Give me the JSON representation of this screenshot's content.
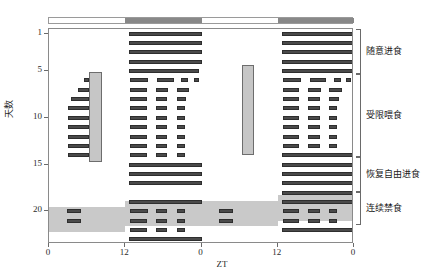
{
  "figure": {
    "type": "actogram",
    "title": "",
    "x_axis": {
      "label": "ZT",
      "ticks": [
        "0",
        "12",
        "0",
        "12",
        "0"
      ],
      "tick_positions_zt": [
        0,
        12,
        24,
        36,
        48
      ],
      "range_hours": [
        0,
        48
      ],
      "double_plotted": true
    },
    "y_axis": {
      "label": "天数",
      "ticks": [
        "1",
        "5",
        "10",
        "15",
        "20"
      ],
      "tick_values": [
        1,
        5,
        10,
        15,
        20
      ],
      "range_days": [
        0.5,
        23.5
      ],
      "direction": "top-to-bottom"
    },
    "light_dark_bar": {
      "segments": [
        {
          "name": "light-phase-day1",
          "zt_start": 0,
          "zt_end": 12,
          "color": "#ffffff"
        },
        {
          "name": "dark-phase-day1",
          "zt_start": 12,
          "zt_end": 24,
          "color": "#888888"
        },
        {
          "name": "light-phase-day2",
          "zt_start": 24,
          "zt_end": 36,
          "color": "#ffffff"
        },
        {
          "name": "dark-phase-day2",
          "zt_start": 36,
          "zt_end": 48,
          "color": "#888888"
        }
      ]
    },
    "phases": [
      {
        "id": "adlib",
        "label": "随意进食",
        "day_start": 0.6,
        "day_end": 5.4
      },
      {
        "id": "restricted",
        "label": "受限喂食",
        "day_start": 5.4,
        "day_end": 14.3
      },
      {
        "id": "refeed",
        "label": "恢复自由进食",
        "day_start": 14.3,
        "day_end": 18.0
      },
      {
        "id": "fasting",
        "label": "连续禁食",
        "day_start": 18.0,
        "day_end": 21.6
      }
    ],
    "feeding_windows": [
      {
        "name": "food-access-window-1",
        "zt_start": 6.3,
        "zt_end": 8.3,
        "day_start": 5.1,
        "day_end": 14.7,
        "color": "#c6c6c6"
      },
      {
        "name": "food-access-window-2",
        "zt_start": 30.3,
        "zt_end": 32.3,
        "day_start": 4.3,
        "day_end": 14.0,
        "color": "#c6c6c6"
      }
    ],
    "fasting_band": {
      "color": "#c9c9c9",
      "steps": [
        {
          "zt_start": 0,
          "zt_end": 12,
          "day_start": 19.5,
          "day_end": 22.2
        },
        {
          "zt_start": 12,
          "zt_end": 36,
          "day_start": 18.9,
          "day_end": 21.6
        },
        {
          "zt_start": 36,
          "zt_end": 48,
          "day_start": 18.3,
          "day_end": 21.0
        }
      ]
    },
    "bar_color": "#4a4a4a",
    "bar_edge_color": "#2e2e2e"
  },
  "chart_data": {
    "type": "actogram",
    "title": "",
    "xlabel": "ZT",
    "ylabel": "天数",
    "xlim": [
      0,
      48
    ],
    "ylim": [
      23.5,
      0.5
    ],
    "xticks": [
      0,
      12,
      24,
      36,
      48
    ],
    "xticklabels": [
      "0",
      "12",
      "0",
      "12",
      "0"
    ],
    "yticks": [
      1,
      5,
      10,
      15,
      20
    ],
    "yticklabels": [
      "1",
      "5",
      "10",
      "15",
      "20"
    ],
    "grid": false,
    "legend": "right-brackets",
    "note": "Each row is one day (double-plotted, 48 h). Bouts listed as [ZT_start, ZT_end].",
    "rows": [
      {
        "day": 1,
        "bouts": [
          [
            12.6,
            24.0
          ],
          [
            36.6,
            48.0
          ]
        ]
      },
      {
        "day": 2,
        "bouts": [
          [
            12.6,
            24.0
          ],
          [
            36.6,
            48.0
          ]
        ]
      },
      {
        "day": 3,
        "bouts": [
          [
            12.6,
            24.0
          ],
          [
            36.6,
            48.0
          ]
        ]
      },
      {
        "day": 4,
        "bouts": [
          [
            12.6,
            24.0
          ],
          [
            36.6,
            48.0
          ]
        ]
      },
      {
        "day": 5,
        "bouts": [
          [
            12.6,
            23.6
          ],
          [
            36.6,
            48.0
          ]
        ]
      },
      {
        "day": 6,
        "bouts": [
          [
            5.5,
            6.3
          ],
          [
            12.8,
            15.6
          ],
          [
            17.0,
            19.6
          ],
          [
            20.8,
            21.9
          ],
          [
            22.8,
            23.6
          ],
          [
            36.8,
            39.6
          ],
          [
            41.0,
            43.6
          ],
          [
            44.8,
            45.9
          ],
          [
            46.8,
            47.6
          ]
        ]
      },
      {
        "day": 7,
        "bouts": [
          [
            4.6,
            6.3
          ],
          [
            12.8,
            15.4
          ],
          [
            16.8,
            18.8
          ],
          [
            20.1,
            22.1
          ],
          [
            36.8,
            39.4
          ],
          [
            40.8,
            42.8
          ],
          [
            44.1,
            46.1
          ]
        ]
      },
      {
        "day": 8,
        "bouts": [
          [
            3.5,
            6.3
          ],
          [
            12.8,
            15.4
          ],
          [
            16.8,
            18.6
          ],
          [
            20.1,
            21.6
          ],
          [
            36.8,
            39.4
          ],
          [
            40.8,
            42.6
          ],
          [
            44.1,
            45.6
          ]
        ]
      },
      {
        "day": 9,
        "bouts": [
          [
            3.0,
            6.3
          ],
          [
            12.8,
            15.4
          ],
          [
            16.8,
            18.6
          ],
          [
            20.1,
            21.4
          ],
          [
            36.8,
            39.4
          ],
          [
            40.8,
            42.6
          ],
          [
            44.1,
            45.4
          ]
        ]
      },
      {
        "day": 10,
        "bouts": [
          [
            3.0,
            6.3
          ],
          [
            12.8,
            15.4
          ],
          [
            16.8,
            18.6
          ],
          [
            20.1,
            21.4
          ],
          [
            36.8,
            39.4
          ],
          [
            40.8,
            42.6
          ],
          [
            44.1,
            45.4
          ]
        ]
      },
      {
        "day": 11,
        "bouts": [
          [
            3.0,
            6.3
          ],
          [
            12.8,
            15.4
          ],
          [
            16.8,
            18.6
          ],
          [
            20.1,
            21.4
          ],
          [
            36.8,
            39.4
          ],
          [
            40.8,
            42.6
          ],
          [
            44.1,
            45.4
          ]
        ]
      },
      {
        "day": 12,
        "bouts": [
          [
            3.0,
            6.3
          ],
          [
            12.8,
            15.4
          ],
          [
            16.8,
            18.6
          ],
          [
            20.1,
            21.4
          ],
          [
            36.8,
            39.4
          ],
          [
            40.8,
            42.6
          ],
          [
            44.1,
            45.4
          ]
        ]
      },
      {
        "day": 13,
        "bouts": [
          [
            3.0,
            6.3
          ],
          [
            12.8,
            15.4
          ],
          [
            16.8,
            18.6
          ],
          [
            20.1,
            21.4
          ],
          [
            36.8,
            39.4
          ],
          [
            40.8,
            42.6
          ],
          [
            44.1,
            45.4
          ]
        ]
      },
      {
        "day": 14,
        "bouts": [
          [
            3.0,
            6.3
          ],
          [
            12.8,
            15.4
          ],
          [
            16.8,
            18.6
          ],
          [
            20.1,
            21.4
          ],
          [
            36.6,
            48.0
          ]
        ]
      },
      {
        "day": 15,
        "bouts": [
          [
            12.6,
            24.0
          ],
          [
            36.6,
            48.0
          ]
        ]
      },
      {
        "day": 16,
        "bouts": [
          [
            12.6,
            24.0
          ],
          [
            36.6,
            48.0
          ]
        ]
      },
      {
        "day": 17,
        "bouts": [
          [
            12.6,
            24.0
          ],
          [
            36.6,
            48.0
          ]
        ]
      },
      {
        "day": 18,
        "bouts": [
          [
            36.6,
            48.0
          ]
        ]
      },
      {
        "day": 19,
        "bouts": [
          [
            12.6,
            24.0
          ],
          [
            36.6,
            48.0
          ]
        ]
      },
      {
        "day": 20,
        "bouts": [
          [
            2.8,
            5.0
          ],
          [
            12.8,
            15.6
          ],
          [
            16.8,
            18.6
          ],
          [
            20.1,
            21.4
          ],
          [
            26.8,
            29.0
          ],
          [
            36.8,
            39.4
          ],
          [
            40.8,
            42.6
          ],
          [
            44.1,
            45.4
          ]
        ]
      },
      {
        "day": 21,
        "bouts": [
          [
            2.8,
            5.0
          ],
          [
            12.8,
            15.4
          ],
          [
            16.8,
            18.6
          ],
          [
            20.1,
            21.4
          ],
          [
            26.8,
            29.0
          ],
          [
            36.8,
            39.4
          ],
          [
            40.8,
            42.6
          ],
          [
            44.1,
            45.4
          ]
        ]
      },
      {
        "day": 22,
        "bouts": [
          [
            12.8,
            15.4
          ],
          [
            16.8,
            18.6
          ],
          [
            20.1,
            21.4
          ],
          [
            36.6,
            48.0
          ]
        ]
      },
      {
        "day": 23,
        "bouts": [
          [
            12.6,
            24.0
          ]
        ]
      }
    ]
  }
}
